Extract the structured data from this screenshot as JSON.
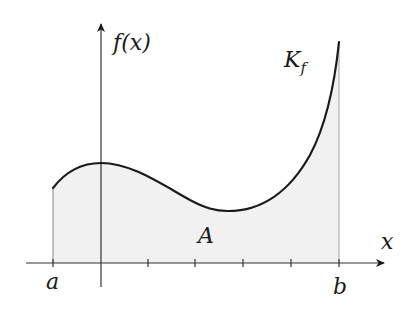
{
  "diagram": {
    "labels": {
      "y_axis": "f(x)",
      "x_axis": "x",
      "curve": "K",
      "curve_subscript": "f",
      "area": "A",
      "left_bound": "a",
      "right_bound": "b"
    },
    "colors": {
      "curve": "#1a1a1a",
      "axes": "#333333",
      "area_fill": "#f1f1f1",
      "bound_lines": "#8a8a8a",
      "background": "#ffffff"
    },
    "x_ticks_count": 4
  }
}
